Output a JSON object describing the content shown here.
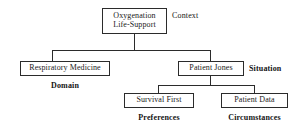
{
  "diagram": {
    "type": "tree",
    "title": "",
    "nodes": {
      "root": {
        "label": "Oxygenation\nLife-Support",
        "role_label": "Context"
      },
      "domain": {
        "label": "Respiratory Medicine",
        "role_label": "Domain"
      },
      "situation": {
        "label": "Patient Jones",
        "role_label": "Situation"
      },
      "preferences": {
        "label": "Survival First",
        "role_label": "Preferences"
      },
      "circumstances": {
        "label": "Patient Data",
        "role_label": "Circumstances"
      }
    },
    "edges": [
      {
        "from": "root",
        "to": "domain"
      },
      {
        "from": "root",
        "to": "situation"
      },
      {
        "from": "situation",
        "to": "preferences"
      },
      {
        "from": "situation",
        "to": "circumstances"
      }
    ],
    "colors": {
      "background": "#ffffff",
      "stroke": "#2b2b2b",
      "text": "#1a1a1a",
      "label_text": "#141414"
    }
  }
}
